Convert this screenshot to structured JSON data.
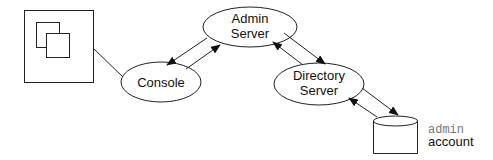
{
  "diagram": {
    "nodes": {
      "screen": {
        "label": ""
      },
      "console": {
        "label": "Console"
      },
      "admin_server": {
        "line1": "Admin",
        "line2": "Server"
      },
      "directory_server": {
        "line1": "Directory",
        "line2": "Server"
      },
      "database": {
        "label_mono": "admin",
        "label": "account"
      }
    },
    "edges": [
      {
        "from": "screen",
        "to": "console",
        "type": "line"
      },
      {
        "from": "console",
        "to": "admin_server",
        "type": "bidirectional-arrows"
      },
      {
        "from": "admin_server",
        "to": "directory_server",
        "type": "bidirectional-arrows"
      },
      {
        "from": "directory_server",
        "to": "database",
        "type": "bidirectional-arrows"
      }
    ],
    "colors": {
      "stroke": "#222222",
      "mono_text": "#777777",
      "background": "#ffffff"
    }
  }
}
